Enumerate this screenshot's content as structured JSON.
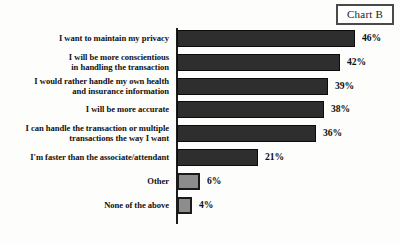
{
  "badge": {
    "label": "Chart B"
  },
  "chart_data": {
    "type": "bar",
    "orientation": "horizontal",
    "title": "Chart B",
    "xlabel": "",
    "ylabel": "",
    "xlim": [
      0,
      50
    ],
    "grid": false,
    "legend": null,
    "value_suffix": "%",
    "categories": [
      "I want to maintain my privacy",
      "I will be more conscientious in handling the transaction",
      "I would rather handle my own health and insurance information",
      "I will be more accurate",
      "I can handle the transaction or multiple transactions the way I want",
      "I'm faster than the associate/attendant",
      "Other",
      "None of the above"
    ],
    "values": [
      46,
      42,
      39,
      38,
      36,
      21,
      6,
      4
    ],
    "value_labels": [
      "46%",
      "42%",
      "39%",
      "38%",
      "36%",
      "21%",
      "6%",
      "4%"
    ],
    "bars": [
      {
        "label_lines": [
          "I want to maintain my privacy"
        ],
        "value": 46,
        "value_label": "46%",
        "style": "dark"
      },
      {
        "label_lines": [
          "I will be more conscientious",
          "in handling the transaction"
        ],
        "value": 42,
        "value_label": "42%",
        "style": "dark"
      },
      {
        "label_lines": [
          "I would rather handle my own health",
          "and insurance information"
        ],
        "value": 39,
        "value_label": "39%",
        "style": "dark"
      },
      {
        "label_lines": [
          "I will be more accurate"
        ],
        "value": 38,
        "value_label": "38%",
        "style": "dark"
      },
      {
        "label_lines": [
          "I can handle the transaction or multiple",
          "transactions the way I want"
        ],
        "value": 36,
        "value_label": "36%",
        "style": "dark"
      },
      {
        "label_lines": [
          "I'm faster than the associate/attendant"
        ],
        "value": 21,
        "value_label": "21%",
        "style": "dark"
      },
      {
        "label_lines": [
          "Other"
        ],
        "value": 6,
        "value_label": "6%",
        "style": "light"
      },
      {
        "label_lines": [
          "None of the above"
        ],
        "value": 4,
        "value_label": "4%",
        "style": "light"
      }
    ],
    "colors": {
      "bar_dark_fill": "#2e2e2e",
      "bar_dark_border": "#0b0b0b",
      "bar_light_fill": "#8d8d8d",
      "bar_light_border": "#1a1a1a",
      "axis": "#1c1c1c",
      "text": "#111111",
      "background": "#fdfdfc"
    }
  }
}
